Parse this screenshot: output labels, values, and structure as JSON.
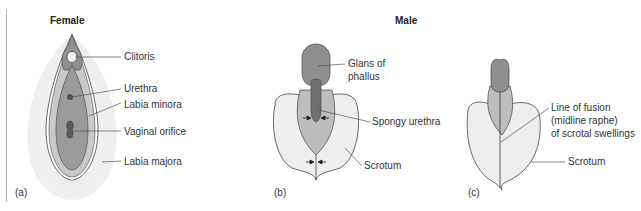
{
  "headings": {
    "female": "Female",
    "male": "Male"
  },
  "panels": {
    "a": "(a)",
    "b": "(b)",
    "c": "(c)"
  },
  "labels_female": {
    "clitoris": "Clitoris",
    "urethra": "Urethra",
    "labia_minora": "Labia minora",
    "vaginal_orifice": "Vaginal orifice",
    "labia_majora": "Labia majora"
  },
  "labels_male_b": {
    "glans_line1": "Glans of",
    "glans_line2": "phallus",
    "spongy_urethra": "Spongy urethra",
    "scrotum": "Scrotum"
  },
  "labels_male_c": {
    "fusion_line1": "Line of fusion",
    "fusion_line2": "(midline raphe)",
    "fusion_line3": "of scrotal swellings",
    "scrotum": "Scrotum"
  },
  "colors": {
    "outer_light": "#efefef",
    "mid_gray": "#bdbdbd",
    "dark_gray": "#8f8f8f",
    "darker_gray": "#6f6f6f",
    "outline": "#444444",
    "leader": "#555555"
  }
}
